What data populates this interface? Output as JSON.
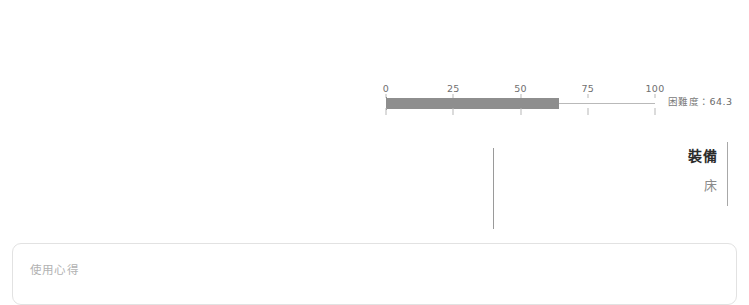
{
  "gauge": {
    "axis": {
      "ticks": [
        {
          "label": "0",
          "value": 0
        },
        {
          "label": "25",
          "value": 25
        },
        {
          "label": "50",
          "value": 50
        },
        {
          "label": "75",
          "value": 75
        },
        {
          "label": "100",
          "value": 100
        }
      ],
      "min": 0,
      "max": 100
    },
    "value": 64.3,
    "readout_label": "困難度",
    "readout_separator": "：",
    "readout_value": "64.3",
    "fill_color": "#8e8e8e",
    "track_color": "#b9b9b9"
  },
  "spec": {
    "title": "裝備",
    "value": "床"
  },
  "comment": {
    "placeholder": "使用心得",
    "value": ""
  },
  "chart_data": {
    "type": "bar",
    "title": "困難度",
    "categories": [
      "困難度"
    ],
    "values": [
      64.3
    ],
    "xlabel": "",
    "ylabel": "",
    "xlim": [
      0,
      100
    ],
    "tick_labels": [
      "0",
      "25",
      "50",
      "75",
      "100"
    ],
    "grid": false,
    "legend": "none",
    "orientation": "horizontal",
    "annotations": [
      "困難度：64.3"
    ]
  }
}
